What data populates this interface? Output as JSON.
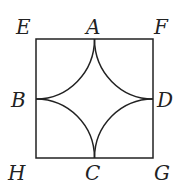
{
  "labels": {
    "E": "E",
    "A": "A",
    "F": "F",
    "B": "B",
    "D": "D",
    "H": "H",
    "C": "C",
    "G": "G"
  }
}
